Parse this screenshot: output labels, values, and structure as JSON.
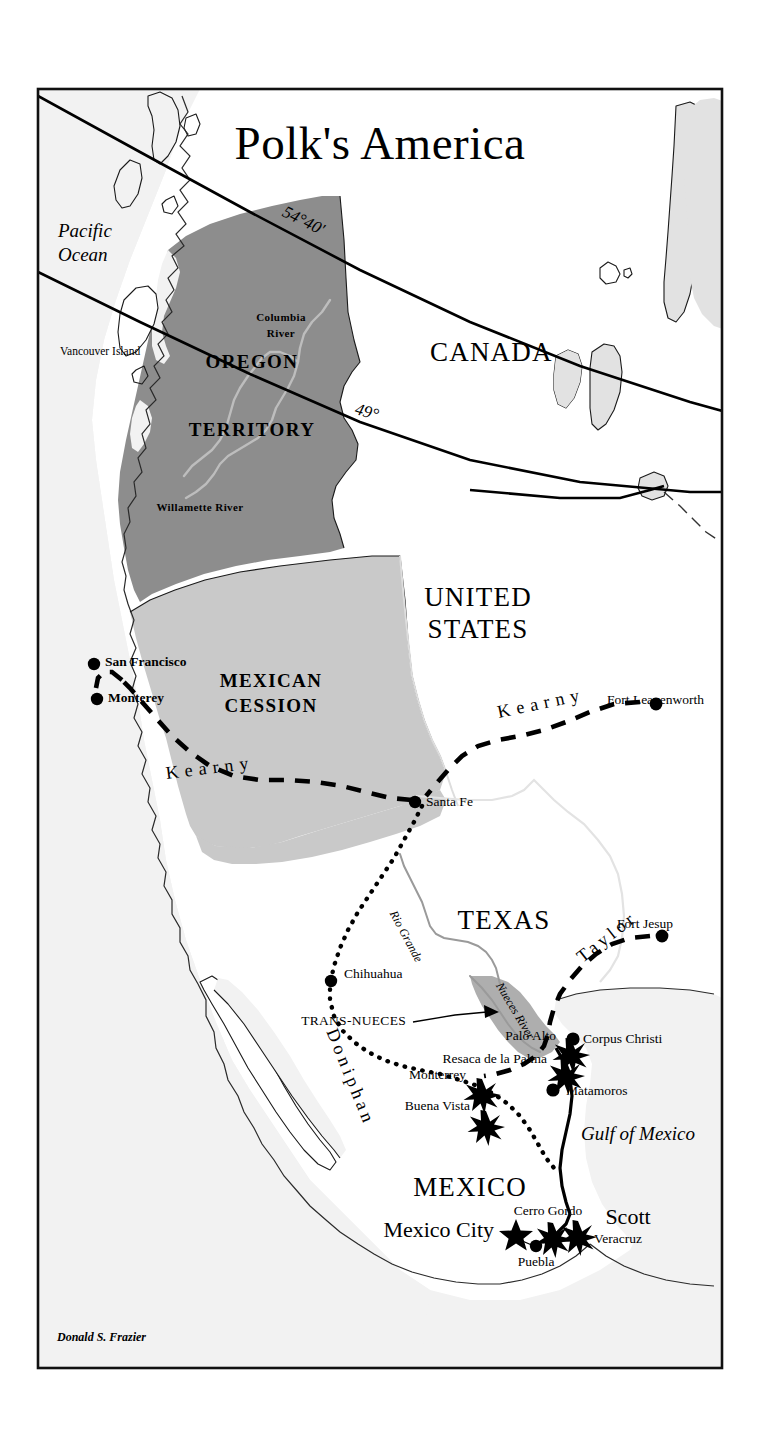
{
  "map": {
    "title": "Polk's America",
    "credit": "Donald  S. Frazier",
    "colors": {
      "oregon_territory_fill": "#8d8d8d",
      "mexican_cession_fill": "#c9c9c9",
      "trans_nueces_fill": "#aeaeae",
      "sea_fill": "#f2f2f2",
      "land_fill": "#ffffff",
      "ink": "#000000"
    },
    "oceans": [
      {
        "name": "pacific-ocean",
        "line1": "Pacific",
        "line2": "Ocean"
      },
      {
        "name": "gulf-of-mexico",
        "label": "Gulf of Mexico"
      }
    ],
    "countries": [
      {
        "name": "canada",
        "label": "CANADA"
      },
      {
        "name": "united-states",
        "line1": "UNITED",
        "line2": "STATES"
      },
      {
        "name": "mexico",
        "label": "MEXICO"
      },
      {
        "name": "texas",
        "label": "TEXAS"
      }
    ],
    "territories": [
      {
        "name": "oregon-territory",
        "line1": "OREGON",
        "line2": "TERRITORY"
      },
      {
        "name": "mexican-cession",
        "line1": "MEXICAN",
        "line2": "CESSION"
      },
      {
        "name": "trans-nueces",
        "label": "TRANS-NUECES"
      }
    ],
    "parallels": [
      {
        "name": "parallel-54-40",
        "label": "54°40'"
      },
      {
        "name": "parallel-49",
        "label": "49°"
      }
    ],
    "rivers": [
      {
        "name": "columbia-river",
        "line1": "Columbia",
        "line2": "River"
      },
      {
        "name": "willamette-river",
        "label": "Willamette River"
      },
      {
        "name": "rio-grande",
        "label": "Rio Grande"
      },
      {
        "name": "nueces-river",
        "label": "Nueces River"
      }
    ],
    "islands": [
      {
        "name": "vancouver-island",
        "label": "Vancouver Island"
      }
    ],
    "routes": [
      {
        "name": "kearny-west",
        "label": "Kearny",
        "style": "dashed"
      },
      {
        "name": "kearny-east",
        "label": "Kearny",
        "style": "dashed"
      },
      {
        "name": "doniphan",
        "label": "Doniphan",
        "style": "dotted"
      },
      {
        "name": "taylor",
        "label": "Taylor",
        "style": "dashed"
      },
      {
        "name": "scott",
        "label": "Scott",
        "style": "solid"
      }
    ],
    "cities": [
      {
        "name": "san-francisco",
        "label": "San Francisco",
        "marker": "dot"
      },
      {
        "name": "monterey",
        "label": "Monterey",
        "marker": "dot"
      },
      {
        "name": "santa-fe",
        "label": "Santa Fe",
        "marker": "dot"
      },
      {
        "name": "fort-leavenworth",
        "label": "Fort Leavenworth",
        "marker": "dot"
      },
      {
        "name": "fort-jesup",
        "label": "Fort Jesup",
        "marker": "dot"
      },
      {
        "name": "chihuahua",
        "label": "Chihuahua",
        "marker": "dot"
      },
      {
        "name": "corpus-christi",
        "label": "Corpus Christi",
        "marker": "dot"
      },
      {
        "name": "matamoros",
        "label": "Matamoros",
        "marker": "dot"
      },
      {
        "name": "veracruz",
        "label": "Veracruz",
        "marker": "star-burst"
      },
      {
        "name": "puebla",
        "label": "Puebla",
        "marker": "dot"
      },
      {
        "name": "mexico-city",
        "label": "Mexico City",
        "marker": "star"
      }
    ],
    "battles": [
      {
        "name": "palo-alto",
        "label": "Palo Alto",
        "marker": "star-burst"
      },
      {
        "name": "resaca-de-la-palma",
        "label": "Resaca de la Palma",
        "marker": "star-burst"
      },
      {
        "name": "monterrey",
        "label": "Monterrey",
        "marker": "star-burst"
      },
      {
        "name": "buena-vista",
        "label": "Buena Vista",
        "marker": "star-burst"
      },
      {
        "name": "cerro-gordo",
        "label": "Cerro Gordo",
        "marker": "star-burst"
      }
    ]
  }
}
